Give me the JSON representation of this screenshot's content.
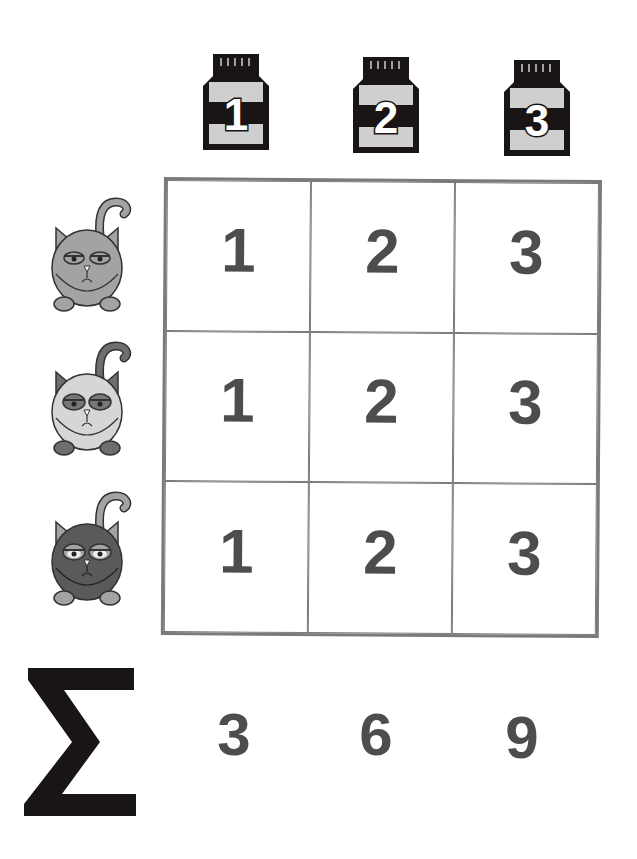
{
  "columns": {
    "jars": [
      {
        "label": "1",
        "icon": "jar-icon"
      },
      {
        "label": "2",
        "icon": "jar-icon"
      },
      {
        "label": "3",
        "icon": "jar-icon"
      }
    ]
  },
  "rows": {
    "cats": [
      {
        "icon": "grumpy-cat-icon",
        "shade": "medium-gray"
      },
      {
        "icon": "grumpy-cat-icon",
        "shade": "light-gray"
      },
      {
        "icon": "grumpy-cat-icon",
        "shade": "dark-gray"
      }
    ]
  },
  "grid": {
    "cells": [
      [
        "1",
        "2",
        "3"
      ],
      [
        "1",
        "2",
        "3"
      ],
      [
        "1",
        "2",
        "3"
      ]
    ]
  },
  "sum_row": {
    "symbol": "Σ",
    "values": [
      "3",
      "6",
      "9"
    ]
  },
  "colors": {
    "grid_line": "#7a7a7a",
    "digit": "#4d4d4d",
    "jar_dark": "#1a1515",
    "jar_light": "#cfcfcf",
    "cat1_body": "#a3a3a3",
    "cat2_body": "#d6d6d6",
    "cat3_body": "#5a5a5a"
  }
}
